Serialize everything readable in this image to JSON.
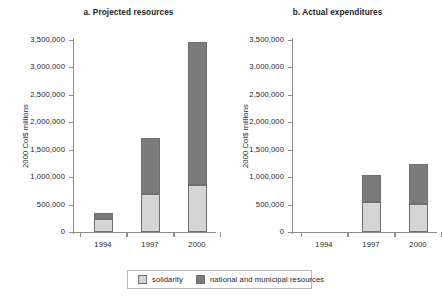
{
  "chart_data": [
    {
      "type": "bar",
      "title": "a. Projected resources",
      "xlabel": "",
      "ylabel": "2000 Col$ millions",
      "categories": [
        "1994",
        "1997",
        "2000"
      ],
      "ylim": [
        0,
        3500000
      ],
      "yticks": [
        0,
        500000,
        1000000,
        1500000,
        2000000,
        2500000,
        3000000,
        3500000
      ],
      "ytick_labels": [
        "0",
        "500,000",
        "1,000,000",
        "1,500,000",
        "2,000,000",
        "2,500,000",
        "3,000,000",
        "3,500,000"
      ],
      "stacked": true,
      "grid": false,
      "legend_position": "bottom",
      "series": [
        {
          "name": "solidarity",
          "color": "#d5d5d3",
          "values": [
            240000,
            690000,
            855000
          ]
        },
        {
          "name": "national and municipal resources",
          "color": "#7b7b7b",
          "values": [
            110000,
            1020000,
            2605000
          ]
        }
      ],
      "totals": [
        350000,
        1710000,
        3460000
      ]
    },
    {
      "type": "bar",
      "title": "b. Actual expenditures",
      "xlabel": "",
      "ylabel": "2000 Col$ millions",
      "categories": [
        "1994",
        "1997",
        "2000"
      ],
      "ylim": [
        0,
        3500000
      ],
      "yticks": [
        0,
        500000,
        1000000,
        1500000,
        2000000,
        2500000,
        3000000,
        3500000
      ],
      "ytick_labels": [
        "0",
        "500,000",
        "1,000,000",
        "1,500,000",
        "2,000,000",
        "2,500,000",
        "3,000,000",
        "3,500,000"
      ],
      "stacked": true,
      "grid": false,
      "legend_position": "bottom",
      "series": [
        {
          "name": "solidarity",
          "color": "#d5d5d3",
          "values": [
            0,
            545000,
            510000
          ]
        },
        {
          "name": "national and municipal resources",
          "color": "#7b7b7b",
          "values": [
            0,
            495000,
            730000
          ]
        }
      ],
      "totals": [
        0,
        1040000,
        1240000
      ]
    }
  ],
  "legend": {
    "items": [
      {
        "label": "solidarity",
        "color": "#d5d5d3"
      },
      {
        "label": "national and municipal resources",
        "color": "#7b7b7b"
      }
    ]
  }
}
